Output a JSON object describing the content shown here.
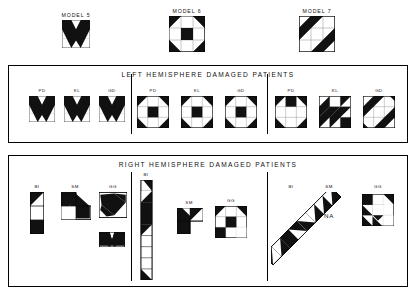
{
  "figure": {
    "models": [
      {
        "id": "model5",
        "label": "MODEL 5",
        "pattern": "chevron-down",
        "x": 60,
        "y": 12,
        "size": 30
      },
      {
        "id": "model6",
        "label": "MODEL 6",
        "pattern": "pinwheel-3x3",
        "x": 168,
        "y": 8,
        "size": 38
      },
      {
        "id": "model7",
        "label": "MODEL 7",
        "pattern": "diagonal-stripes-3x3",
        "x": 298,
        "y": 8,
        "size": 38
      }
    ],
    "panels": [
      {
        "id": "left-hemisphere",
        "title": "LEFT HEMISPHERE DAMAGED PATIENTS",
        "x": 8,
        "y": 65,
        "w": 400,
        "h": 78,
        "dividers": [
          122,
          258
        ],
        "groups": [
          {
            "id": "lh-model5",
            "model": "chevron-down",
            "patients": [
              {
                "label": "PD",
                "x": 20,
                "y": 26,
                "w": 26,
                "h": 26,
                "pattern": "chevron-down"
              },
              {
                "label": "KL",
                "x": 55,
                "y": 26,
                "w": 26,
                "h": 26,
                "pattern": "chevron-down"
              },
              {
                "label": "GD",
                "x": 90,
                "y": 26,
                "w": 26,
                "h": 26,
                "pattern": "chevron-down"
              }
            ]
          },
          {
            "id": "lh-model6",
            "model": "pinwheel-3x3",
            "patients": [
              {
                "label": "PD",
                "x": 128,
                "y": 24,
                "w": 32,
                "h": 32,
                "pattern": "pinwheel-3x3"
              },
              {
                "label": "KL",
                "x": 172,
                "y": 24,
                "w": 32,
                "h": 32,
                "pattern": "pinwheel-3x3"
              },
              {
                "label": "GD",
                "x": 216,
                "y": 24,
                "w": 32,
                "h": 32,
                "pattern": "pinwheel-3x3"
              }
            ]
          },
          {
            "id": "lh-model7",
            "model": "diagonal-stripes-3x3",
            "patients": [
              {
                "label": "PD",
                "x": 266,
                "y": 24,
                "w": 32,
                "h": 32,
                "pattern": "corners-notch-3x3"
              },
              {
                "label": "KL",
                "x": 310,
                "y": 24,
                "w": 32,
                "h": 32,
                "pattern": "diagonal-stripes-partial"
              },
              {
                "label": "GD",
                "x": 354,
                "y": 24,
                "w": 32,
                "h": 32,
                "pattern": "diagonal-stripes-3x3"
              }
            ]
          }
        ]
      },
      {
        "id": "right-hemisphere",
        "title": "RIGHT HEMISPHERE DAMAGED PATIENTS",
        "x": 8,
        "y": 155,
        "w": 400,
        "h": 132,
        "dividers": [
          122,
          258
        ],
        "groups": [
          {
            "id": "rh-model5",
            "model": "chevron-down",
            "patients": [
              {
                "label": "BI",
                "x": 20,
                "y": 28,
                "w": 13,
                "h": 40,
                "pattern": "vertical-3stack"
              },
              {
                "label": "SM",
                "x": 52,
                "y": 28,
                "w": 30,
                "h": 28,
                "pattern": "arrow-up-left"
              },
              {
                "label": "GG",
                "x": 90,
                "y": 26,
                "w": 28,
                "h": 26,
                "pattern": "rotated-chevron"
              },
              {
                "label": "",
                "x": 90,
                "y": 68,
                "w": 24,
                "h": 14,
                "pattern": "chevron-wide-flat"
              }
            ]
          },
          {
            "id": "rh-model6",
            "model": "pinwheel-3x3",
            "patients": [
              {
                "label": "BI",
                "x": 130,
                "y": 16,
                "w": 14,
                "h": 100,
                "pattern": "tall-column-9"
              },
              {
                "label": "SM",
                "x": 168,
                "y": 38,
                "w": 24,
                "h": 24,
                "pattern": "two-by-two-partial"
              },
              {
                "label": "GG",
                "x": 206,
                "y": 34,
                "w": 32,
                "h": 32,
                "pattern": "pinwheel-3x3-var"
              }
            ]
          },
          {
            "id": "rh-model7",
            "model": "diagonal-stripes-3x3",
            "patients": [
              {
                "label": "BI",
                "x": 266,
                "y": 22,
                "w": 70,
                "h": 95,
                "pattern": "diagonal-chain"
              },
              {
                "label": "SM",
                "x": 300,
                "y": 34,
                "w": 0,
                "h": 0,
                "pattern": "na",
                "value": "NA"
              },
              {
                "label": "GG",
                "x": 352,
                "y": 30,
                "w": 32,
                "h": 32,
                "pattern": "diagonal-stripes-var"
              }
            ]
          }
        ]
      }
    ]
  }
}
